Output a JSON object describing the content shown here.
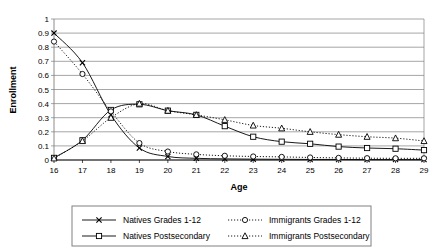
{
  "chart_data": {
    "type": "line",
    "title": "",
    "xlabel": "Age",
    "ylabel": "Enrollment",
    "x": [
      16,
      17,
      18,
      19,
      20,
      21,
      22,
      23,
      24,
      25,
      26,
      27,
      28,
      29
    ],
    "xtick_labels": [
      "16",
      "17",
      "18",
      "19",
      "20",
      "21",
      "22",
      "23",
      "24",
      "25",
      "26",
      "27",
      "28",
      "29"
    ],
    "ytick_labels": [
      "0",
      "0.1",
      "0.2",
      "0.3",
      "0.4",
      "0.5",
      "0.6",
      "0.7",
      "0.8",
      "0.9",
      "1"
    ],
    "xlim": [
      16,
      29
    ],
    "ylim": [
      0,
      1
    ],
    "grid": "horizontal",
    "legend_position": "bottom",
    "series": [
      {
        "name": "Natives Grades 1-12",
        "marker": "x-marker",
        "line_style": "solid",
        "color": "#000000",
        "values": [
          0.9,
          0.69,
          0.32,
          0.085,
          0.025,
          0.012,
          0.008,
          0.006,
          0.005,
          0.004,
          0.004,
          0.003,
          0.003,
          0.003
        ]
      },
      {
        "name": "Natives Postsecondary",
        "marker": "square-marker",
        "line_style": "solid",
        "color": "#000000",
        "values": [
          0.015,
          0.14,
          0.355,
          0.395,
          0.35,
          0.32,
          0.24,
          0.165,
          0.13,
          0.115,
          0.095,
          0.085,
          0.08,
          0.07
        ]
      },
      {
        "name": "Immigrants Grades 1-12",
        "marker": "circle-marker",
        "line_style": "dotted",
        "color": "#000000",
        "values": [
          0.84,
          0.61,
          0.345,
          0.12,
          0.06,
          0.04,
          0.03,
          0.025,
          0.022,
          0.018,
          0.015,
          0.013,
          0.012,
          0.012
        ]
      },
      {
        "name": "Immigrants Postsecondary",
        "marker": "triangle-marker",
        "line_style": "dotted",
        "color": "#000000",
        "values": [
          0.012,
          0.135,
          0.3,
          0.4,
          0.35,
          0.32,
          0.285,
          0.245,
          0.225,
          0.2,
          0.18,
          0.165,
          0.155,
          0.135
        ]
      }
    ]
  },
  "legend": {
    "entries": [
      {
        "label": "Natives Grades 1-12"
      },
      {
        "label": "Immigrants Grades 1-12"
      },
      {
        "label": "Natives Postsecondary"
      },
      {
        "label": "Immigrants Postsecondary"
      }
    ]
  },
  "colors": {
    "line": "#000000",
    "grid": "#808080",
    "axis": "#808080",
    "background": "#ffffff"
  }
}
